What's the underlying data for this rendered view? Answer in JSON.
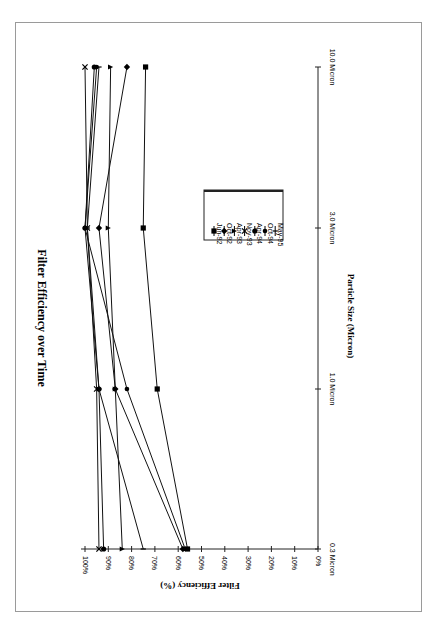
{
  "chart_data": {
    "type": "line",
    "title": "Filter Efficiency over Time",
    "xlabel": "Particle Size (Micron)",
    "ylabel": "Filter Efficiency (%)",
    "categories": [
      "0.3 Micron",
      "1.0 Micron",
      "3.0 Micron",
      "10.0 Micron"
    ],
    "yticks": [
      "0%",
      "10%",
      "20%",
      "30%",
      "40%",
      "50%",
      "60%",
      "70%",
      "80%",
      "90%",
      "100%"
    ],
    "ylim": [
      0,
      100
    ],
    "orientation": "rotated 90 degrees clockwise on page",
    "legend_position": "center-right of plot area",
    "grid": false,
    "series": [
      {
        "name": "Jun-92",
        "marker": "square",
        "values": [
          56,
          69,
          75,
          74
        ]
      },
      {
        "name": "Oct-92",
        "marker": "diamond",
        "values": [
          58,
          87,
          94,
          82
        ]
      },
      {
        "name": "Apr-93",
        "marker": "triangle",
        "values": [
          84,
          87,
          90,
          89
        ]
      },
      {
        "name": "Nov-93",
        "marker": "x",
        "values": [
          94,
          95,
          99,
          100
        ]
      },
      {
        "name": "Apr-94",
        "marker": "circle",
        "values": [
          92,
          94,
          100,
          96
        ]
      },
      {
        "name": "Oct-94",
        "marker": "dot",
        "values": [
          57,
          82,
          100,
          95
        ]
      },
      {
        "name": "May-95",
        "marker": "plus",
        "values": [
          75,
          94,
          99,
          94
        ]
      }
    ]
  }
}
